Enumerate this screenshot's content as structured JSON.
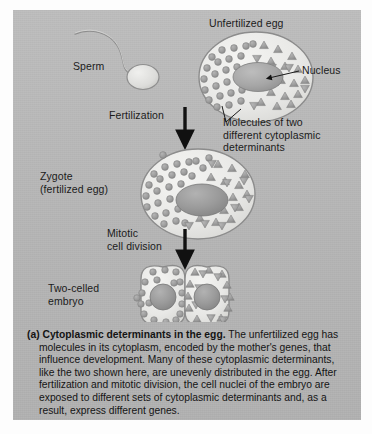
{
  "figure": {
    "panel_background": "#b6b6b6",
    "page_background": "#ffffff",
    "ink_color": "#1b1b1b"
  },
  "diagram": {
    "labels": {
      "unfertilized_egg": "Unfertilized egg",
      "sperm": "Sperm",
      "nucleus": "Nucleus",
      "fertilization": "Fertilization",
      "molecules": "Molecules of two\ndifferent cytoplasmic\ndeterminants",
      "zygote": "Zygote\n(fertilized egg)",
      "mitotic": "Mitotic\ncell division",
      "two_celled_embryo": "Two-celled\nembryo"
    },
    "stages": [
      {
        "name": "unfertilized-egg",
        "determinant_circles": 26,
        "determinant_triangles": 22,
        "nucleus": "oval"
      },
      {
        "name": "zygote",
        "determinant_circles": 26,
        "determinant_triangles": 24,
        "nucleus": "oval-dark"
      },
      {
        "name": "two-celled-embryo",
        "left_cell_determinants": "circles",
        "right_cell_determinants": "triangles",
        "nucleus": "round"
      }
    ],
    "arrows": [
      {
        "name": "fertilization-arrow",
        "direction": "down"
      },
      {
        "name": "mitotic-division-arrow",
        "direction": "down"
      }
    ],
    "colors": {
      "cell_fill": "#e9e9e7",
      "cell_stroke": "#8d8d8d",
      "determinant_fill": "#9a9a9a",
      "nucleus_fill": "#a5a5a5",
      "arrow": "#111111"
    }
  },
  "caption": {
    "lead": "(a) Cytoplasmic determinants in the egg.",
    "body": " The unfertilized egg has molecules in its cytoplasm, encoded by the mother's genes, that influence development. Many of these cytoplasmic determinants, like the two shown here, are unevenly distributed in the egg. After fertilization and mitotic division, the cell nuclei of the embryo are exposed to different sets of cytoplasmic determinants and, as a result, express different genes."
  }
}
